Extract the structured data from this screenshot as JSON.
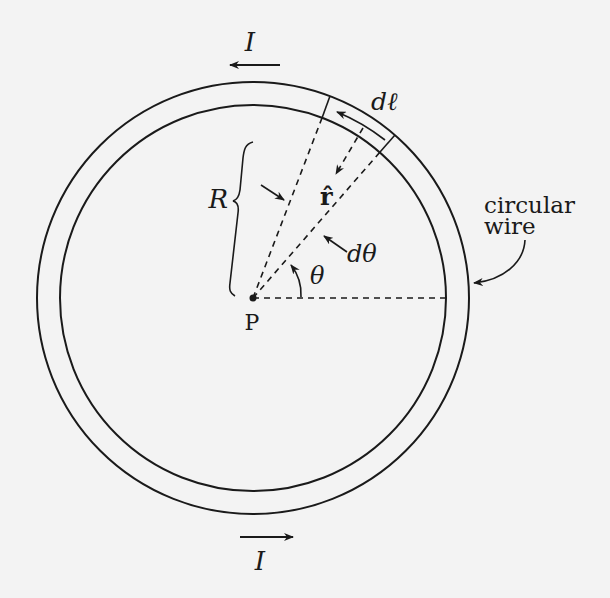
{
  "diagram": {
    "labels": {
      "current_top": "I",
      "current_bottom": "I",
      "dl": "dℓ",
      "r_hat": "r̂",
      "radius": "R",
      "d_theta": "dθ",
      "theta": "θ",
      "point": "P",
      "wire_line1": "circular",
      "wire_line2": "wire"
    },
    "geometry": {
      "center": [
        253,
        298
      ],
      "outer_radius": 216,
      "inner_radius": 193,
      "line_a_angle_deg": 69,
      "line_b_angle_deg": 49,
      "rhat_angle_deg": 59
    },
    "colors": {
      "background": "#f3f3f3",
      "ink": "#1a1a1a"
    }
  }
}
